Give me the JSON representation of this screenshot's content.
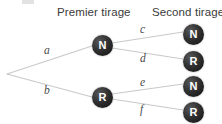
{
  "diagram": {
    "type": "probability-tree",
    "background_color": "#ffffff",
    "edge_color": "#c9c9c9",
    "node_fill_color": "#222222",
    "node_text_color": "#ffffff",
    "header_text_color": "#3b3b3b",
    "label_text_color": "#4a4a4a",
    "headers": {
      "level1": "Premier tirage",
      "level2": "Second tirage"
    },
    "root": {
      "label": "",
      "x": 6,
      "y": 73
    },
    "level1_nodes": [
      {
        "id": "n1",
        "label": "N",
        "x": 92,
        "y": 35
      },
      {
        "id": "n2",
        "label": "R",
        "x": 92,
        "y": 87
      }
    ],
    "level2_nodes": [
      {
        "id": "n1a",
        "label": "N",
        "x": 183,
        "y": 24
      },
      {
        "id": "n1b",
        "label": "R",
        "x": 183,
        "y": 51
      },
      {
        "id": "n2a",
        "label": "N",
        "x": 183,
        "y": 76
      },
      {
        "id": "n2b",
        "label": "R",
        "x": 183,
        "y": 102
      }
    ],
    "edges": [
      {
        "id": "e-a",
        "label": "a",
        "from": "root",
        "to": "n1",
        "x1": 7,
        "y1": 74,
        "x2": 92,
        "y2": 46,
        "lx": 44,
        "ly": 44
      },
      {
        "id": "e-b",
        "label": "b",
        "from": "root",
        "to": "n2",
        "x1": 7,
        "y1": 74,
        "x2": 92,
        "y2": 97,
        "lx": 44,
        "ly": 84
      },
      {
        "id": "e-c",
        "label": "c",
        "from": "n1",
        "to": "n1a",
        "x1": 112,
        "y1": 43,
        "x2": 183,
        "y2": 32,
        "lx": 140,
        "ly": 23
      },
      {
        "id": "e-d",
        "label": "d",
        "from": "n1",
        "to": "n1b",
        "x1": 112,
        "y1": 48,
        "x2": 183,
        "y2": 59,
        "lx": 140,
        "ly": 52
      },
      {
        "id": "e-e",
        "label": "e",
        "from": "n2",
        "to": "n2a",
        "x1": 112,
        "y1": 94,
        "x2": 183,
        "y2": 84,
        "lx": 140,
        "ly": 76
      },
      {
        "id": "e-f",
        "label": "f",
        "from": "n2",
        "to": "n2b",
        "x1": 112,
        "y1": 99,
        "x2": 183,
        "y2": 110,
        "lx": 140,
        "ly": 103
      }
    ]
  }
}
